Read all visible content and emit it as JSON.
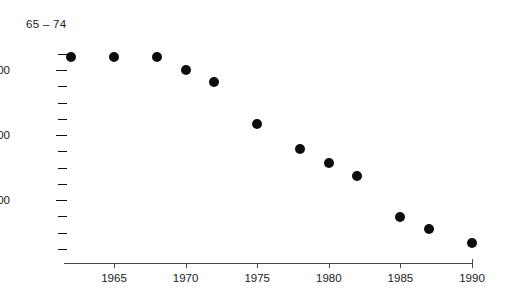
{
  "chart_data": {
    "type": "scatter",
    "title": "65 – 74",
    "xlabel": "",
    "ylabel": "",
    "grid": false,
    "legend": null,
    "xlim": [
      1961,
      1991
    ],
    "ylim": [
      0,
      5600
    ],
    "x_ticks": [
      1965,
      1970,
      1975,
      1980,
      1985,
      1990
    ],
    "x_tick_labels": [
      "1965",
      "1970",
      "1975",
      "1980",
      "1985",
      "1990"
    ],
    "y_ticks": [
      400,
      800,
      1200,
      1600,
      2000,
      2400,
      2800,
      3200,
      3600,
      4000,
      4400,
      4800,
      5200
    ],
    "y_major_ticks": [
      1600,
      3200,
      4800
    ],
    "y_tick_labels": [
      "1600",
      "3200",
      "4800"
    ],
    "x": [
      1962,
      1965,
      1968,
      1970,
      1972,
      1975,
      1978,
      1980,
      1982,
      1985,
      1987,
      1990
    ],
    "values": [
      5120,
      5120,
      5120,
      4800,
      4500,
      3470,
      2860,
      2510,
      2190,
      1180,
      890,
      545
    ],
    "points": [
      {
        "x": 1962,
        "y": 5120
      },
      {
        "x": 1965,
        "y": 5120
      },
      {
        "x": 1968,
        "y": 5120
      },
      {
        "x": 1970,
        "y": 4800
      },
      {
        "x": 1972,
        "y": 4500
      },
      {
        "x": 1975,
        "y": 3470
      },
      {
        "x": 1978,
        "y": 2860
      },
      {
        "x": 1980,
        "y": 2510
      },
      {
        "x": 1982,
        "y": 2190
      },
      {
        "x": 1985,
        "y": 1180
      },
      {
        "x": 1987,
        "y": 890
      },
      {
        "x": 1990,
        "y": 545
      }
    ],
    "marker": "circle",
    "marker_color": "#0d0d0d",
    "axis_color": "#4a4a4a",
    "text_color": "#1a1a1a"
  }
}
